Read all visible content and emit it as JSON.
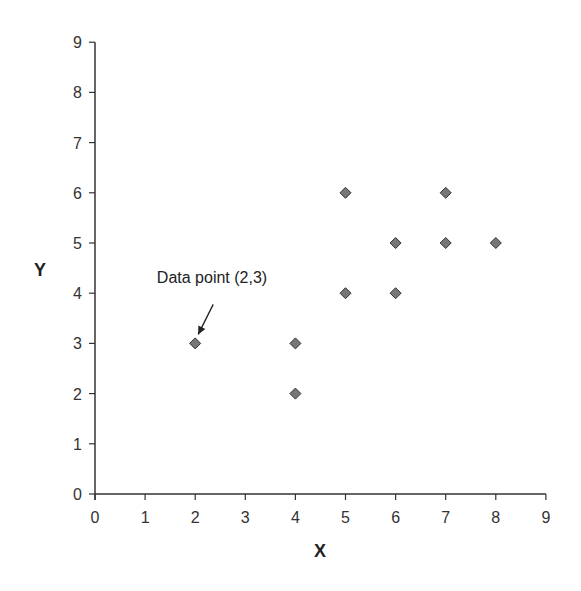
{
  "chart_data": {
    "type": "scatter",
    "title": "",
    "xlabel": "X",
    "ylabel": "Y",
    "xlim": [
      0,
      9
    ],
    "ylim": [
      0,
      9
    ],
    "x_ticks": [
      "0",
      "1",
      "2",
      "3",
      "4",
      "5",
      "6",
      "7",
      "8",
      "9"
    ],
    "y_ticks": [
      "0",
      "1",
      "2",
      "3",
      "4",
      "5",
      "6",
      "7",
      "8",
      "9"
    ],
    "grid": false,
    "legend": null,
    "marker": "diamond",
    "marker_color": "#777777",
    "marker_edge_color": "#333333",
    "series": [
      {
        "name": "Data",
        "points": [
          {
            "x": 2,
            "y": 3
          },
          {
            "x": 4,
            "y": 3
          },
          {
            "x": 4,
            "y": 2
          },
          {
            "x": 5,
            "y": 6
          },
          {
            "x": 5,
            "y": 4
          },
          {
            "x": 6,
            "y": 5
          },
          {
            "x": 6,
            "y": 4
          },
          {
            "x": 7,
            "y": 6
          },
          {
            "x": 7,
            "y": 5
          },
          {
            "x": 8,
            "y": 5
          }
        ]
      }
    ],
    "annotations": [
      {
        "text": "Data point (2,3)",
        "target": {
          "x": 2,
          "y": 3
        },
        "arrow": true
      }
    ]
  }
}
